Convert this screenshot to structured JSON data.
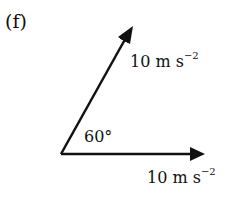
{
  "part_label": "(f)",
  "angle_label": "60°",
  "vectors": [
    {
      "name": "inclined-vector",
      "magnitude": "10",
      "unit": "m s",
      "exponent": "−2",
      "angle_deg": 60
    },
    {
      "name": "horizontal-vector",
      "magnitude": "10",
      "unit": "m s",
      "exponent": "−2",
      "angle_deg": 0
    }
  ],
  "colors": {
    "ink": "#111111",
    "background": "#ffffff"
  }
}
